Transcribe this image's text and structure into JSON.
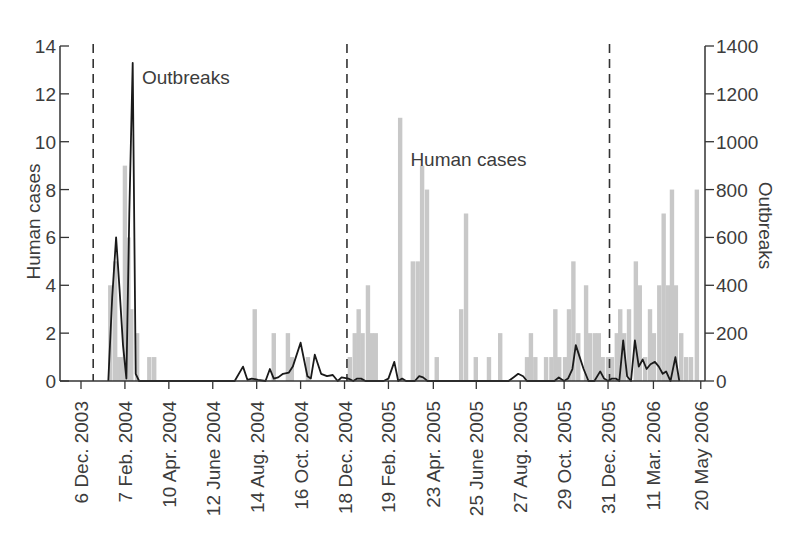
{
  "chart_data": {
    "type": "bar+line",
    "title": "",
    "xlabel": "",
    "ylabel": "Human cases",
    "ylabel_right": "Outbreaks",
    "ylim": [
      0,
      14
    ],
    "ylim_right": [
      0,
      1400
    ],
    "yticks": [
      0,
      2,
      4,
      6,
      8,
      10,
      12,
      14
    ],
    "yticks_right": [
      0,
      200,
      400,
      600,
      800,
      1000,
      1200,
      1400
    ],
    "xtick_labels": [
      "6 Dec. 2003",
      "7 Feb. 2004",
      "10 Apr. 2004",
      "12 June 2004",
      "14 Aug. 2004",
      "16 Oct. 2004",
      "18 Dec. 2004",
      "19 Feb. 2005",
      "23 Apr. 2005",
      "25 June 2005",
      "27 Aug. 2005",
      "29 Oct. 2005",
      "31 Dec. 2005",
      "11 Mar. 2006",
      "20 May 2006"
    ],
    "xtick_week_index": [
      0,
      9,
      18,
      27,
      36,
      45,
      54,
      63,
      72.2,
      81,
      90,
      99,
      108,
      117.3,
      127
    ],
    "bin": "week",
    "dashed_lines_week_index": [
      2.5,
      54.5,
      108.3
    ],
    "annotations": [
      {
        "text": "Outbreaks",
        "x_week": 12.5,
        "y_left": 12.4
      },
      {
        "text": "Human cases",
        "x_week": 67.5,
        "y_left": 9.0
      }
    ],
    "legend": null,
    "grid": false,
    "series": [
      {
        "name": "Human cases",
        "type": "bar",
        "axis": "left",
        "color": "#c8c8c8",
        "points": [
          [
            6,
            4
          ],
          [
            7,
            5
          ],
          [
            7.7,
            1
          ],
          [
            8.3,
            1
          ],
          [
            9,
            9
          ],
          [
            9.7,
            6
          ],
          [
            10.3,
            3
          ],
          [
            11.5,
            2
          ],
          [
            14,
            1
          ],
          [
            15,
            1
          ],
          [
            35.6,
            3
          ],
          [
            39.5,
            2
          ],
          [
            42.4,
            2
          ],
          [
            43.2,
            1
          ],
          [
            46.5,
            1
          ],
          [
            55.1,
            1
          ],
          [
            56.1,
            2
          ],
          [
            56.9,
            3
          ],
          [
            57.7,
            2
          ],
          [
            58.8,
            4
          ],
          [
            59.6,
            2
          ],
          [
            60.4,
            2
          ],
          [
            65.4,
            11
          ],
          [
            68,
            5
          ],
          [
            69,
            5
          ],
          [
            69.9,
            9
          ],
          [
            70.9,
            8
          ],
          [
            72.9,
            1
          ],
          [
            77.9,
            3
          ],
          [
            78.9,
            7
          ],
          [
            80.9,
            1
          ],
          [
            83.6,
            1
          ],
          [
            85.9,
            2
          ],
          [
            91.4,
            1
          ],
          [
            92.2,
            2
          ],
          [
            93.1,
            1
          ],
          [
            95.3,
            1
          ],
          [
            96.4,
            1
          ],
          [
            97.2,
            3
          ],
          [
            98,
            1
          ],
          [
            99.2,
            1
          ],
          [
            100,
            3
          ],
          [
            100.9,
            5
          ],
          [
            101.9,
            2
          ],
          [
            103.5,
            4
          ],
          [
            104.3,
            2
          ],
          [
            105.3,
            2
          ],
          [
            106.1,
            2
          ],
          [
            106.9,
            1
          ],
          [
            108,
            1
          ],
          [
            108.8,
            1
          ],
          [
            109.8,
            2
          ],
          [
            110.5,
            3
          ],
          [
            111.3,
            2
          ],
          [
            112.3,
            3
          ],
          [
            113.7,
            5
          ],
          [
            114.5,
            4
          ],
          [
            115.6,
            1
          ],
          [
            116.6,
            3
          ],
          [
            117.4,
            2
          ],
          [
            118.5,
            4
          ],
          [
            119.4,
            7
          ],
          [
            120.3,
            4
          ],
          [
            121.1,
            8
          ],
          [
            121.9,
            4
          ],
          [
            123,
            2
          ],
          [
            124,
            1
          ],
          [
            125,
            1
          ],
          [
            126.2,
            8
          ]
        ]
      },
      {
        "name": "Outbreaks",
        "type": "line",
        "axis": "right",
        "color": "#1a1a1a",
        "points": [
          [
            5.6,
            0
          ],
          [
            6.4,
            350
          ],
          [
            7.2,
            600
          ],
          [
            7.9,
            380
          ],
          [
            8.6,
            150
          ],
          [
            9.3,
            10
          ],
          [
            9.9,
            700
          ],
          [
            10.6,
            1330
          ],
          [
            11.2,
            30
          ],
          [
            11.9,
            0
          ],
          [
            31.5,
            0
          ],
          [
            33.2,
            60
          ],
          [
            34.1,
            5
          ],
          [
            35,
            10
          ],
          [
            36.3,
            5
          ],
          [
            37.8,
            0
          ],
          [
            38.7,
            50
          ],
          [
            39.5,
            10
          ],
          [
            40.4,
            15
          ],
          [
            41.4,
            30
          ],
          [
            42.6,
            35
          ],
          [
            43.4,
            60
          ],
          [
            45,
            160
          ],
          [
            46.4,
            20
          ],
          [
            47.1,
            10
          ],
          [
            47.9,
            110
          ],
          [
            49.2,
            30
          ],
          [
            50.4,
            20
          ],
          [
            51.6,
            25
          ],
          [
            52.6,
            0
          ],
          [
            53.4,
            15
          ],
          [
            54.8,
            10
          ],
          [
            55.8,
            0
          ],
          [
            56.6,
            10
          ],
          [
            57.4,
            10
          ],
          [
            58.3,
            0
          ],
          [
            62,
            0
          ],
          [
            63,
            10
          ],
          [
            64.2,
            80
          ],
          [
            65,
            0
          ],
          [
            65.8,
            10
          ],
          [
            66.6,
            0
          ],
          [
            68.4,
            0
          ],
          [
            69.3,
            20
          ],
          [
            70.1,
            15
          ],
          [
            71,
            0
          ],
          [
            87.6,
            0
          ],
          [
            88.6,
            15
          ],
          [
            89.6,
            30
          ],
          [
            90.6,
            20
          ],
          [
            91.4,
            0
          ],
          [
            97,
            0
          ],
          [
            97.9,
            15
          ],
          [
            99,
            0
          ],
          [
            99.8,
            10
          ],
          [
            100.7,
            50
          ],
          [
            101.4,
            150
          ],
          [
            102.2,
            100
          ],
          [
            103,
            50
          ],
          [
            104,
            0
          ],
          [
            105.2,
            0
          ],
          [
            106.4,
            40
          ],
          [
            107.2,
            10
          ],
          [
            108,
            0
          ],
          [
            108.8,
            10
          ],
          [
            109.6,
            10
          ],
          [
            110.3,
            0
          ],
          [
            111.1,
            170
          ],
          [
            111.9,
            20
          ],
          [
            112.7,
            0
          ],
          [
            113.5,
            170
          ],
          [
            114.3,
            60
          ],
          [
            115.1,
            90
          ],
          [
            115.9,
            50
          ],
          [
            116.7,
            70
          ],
          [
            117.6,
            80
          ],
          [
            118.4,
            60
          ],
          [
            119.2,
            30
          ],
          [
            119.9,
            40
          ],
          [
            120.8,
            0
          ],
          [
            121.8,
            100
          ],
          [
            122.6,
            0
          ]
        ]
      }
    ]
  }
}
